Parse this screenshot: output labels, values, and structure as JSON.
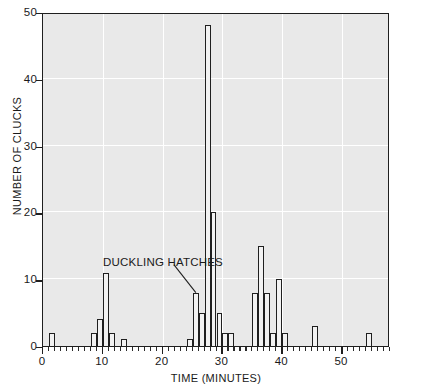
{
  "chart_data": {
    "type": "bar",
    "title": "",
    "xlabel": "TIME (MINUTES)",
    "ylabel": "NUMBER OF CLUCKS",
    "xlim": [
      0,
      58
    ],
    "ylim": [
      0,
      50
    ],
    "xticks": [
      0,
      10,
      20,
      30,
      40,
      50
    ],
    "yticks": [
      0,
      10,
      20,
      30,
      40,
      50
    ],
    "xtick_labels": [
      "0",
      "10",
      "20",
      "30",
      "40",
      "50"
    ],
    "ytick_labels": [
      "0",
      "10",
      "20",
      "30",
      "40",
      "50"
    ],
    "bin_width": 1,
    "grid": true,
    "legend": "none",
    "categories": [
      1,
      8,
      9,
      10,
      11,
      24,
      25,
      26,
      27,
      28,
      29,
      30,
      31,
      35,
      36,
      37,
      38,
      39,
      40,
      41,
      46,
      55
    ],
    "values": [
      2,
      2,
      4,
      11,
      2,
      1,
      8,
      5,
      48,
      20,
      5,
      4,
      2,
      8,
      15,
      8,
      2,
      10,
      2,
      3,
      2,
      0
    ],
    "bars": [
      {
        "x": 1,
        "height": 2
      },
      {
        "x": 8,
        "height": 2
      },
      {
        "x": 9,
        "height": 4
      },
      {
        "x": 10,
        "height": 11
      },
      {
        "x": 11,
        "height": 2
      },
      {
        "x": 13,
        "height": 1
      },
      {
        "x": 24,
        "height": 1
      },
      {
        "x": 25,
        "height": 8
      },
      {
        "x": 26,
        "height": 5
      },
      {
        "x": 27,
        "height": 48
      },
      {
        "x": 28,
        "height": 20
      },
      {
        "x": 29,
        "height": 5
      },
      {
        "x": 30,
        "height": 2
      },
      {
        "x": 31,
        "height": 2
      },
      {
        "x": 35,
        "height": 8
      },
      {
        "x": 36,
        "height": 15
      },
      {
        "x": 37,
        "height": 8
      },
      {
        "x": 38,
        "height": 2
      },
      {
        "x": 39,
        "height": 10
      },
      {
        "x": 40,
        "height": 2
      },
      {
        "x": 45,
        "height": 3
      },
      {
        "x": 54,
        "height": 2
      }
    ],
    "annotations": [
      {
        "text": "DUCKLING HATCHES",
        "target_x": 25,
        "target_y": 8
      }
    ]
  },
  "annotation": {
    "label": "DUCKLING HATCHES"
  },
  "axes": {
    "x_title": "TIME (MINUTES)",
    "y_title": "NUMBER OF CLUCKS"
  },
  "colors": {
    "plot_background": "#e9e9e9",
    "gridline": "#ffffff",
    "bar_fill": "#f2f2f2",
    "bar_stroke": "#1f1f1f",
    "axis": "#1f1f1f",
    "text": "#1a1a1a"
  }
}
